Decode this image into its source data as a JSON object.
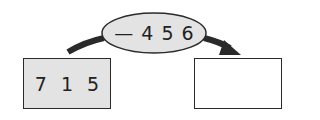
{
  "diagram": {
    "start_box": {
      "digits": [
        "7",
        "1",
        "5"
      ],
      "fill": "#e3e3e3"
    },
    "operation": {
      "sign": "—",
      "digits": [
        "4",
        "5",
        "6"
      ],
      "fill": "#e3e3e3"
    },
    "result_box": {
      "value": ""
    },
    "arrow_color": "#2a2a2a"
  }
}
